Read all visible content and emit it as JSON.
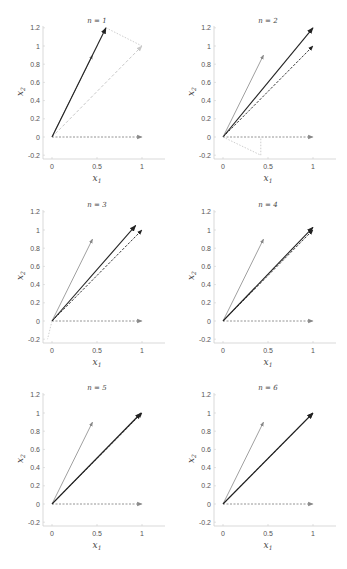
{
  "figure": {
    "panel_titles": [
      "n = 1",
      "n = 2",
      "n = 3",
      "n = 4",
      "n = 5",
      "n = 6"
    ],
    "xlabel": "x",
    "xlabel_sub": "1",
    "ylabel": "x",
    "ylabel_sub": "2",
    "xticks": [
      "0",
      "0.5",
      "1"
    ],
    "yticks": [
      "-0.2",
      "0",
      "0.2",
      "0.4",
      "0.6",
      "0.8",
      "1",
      "1.2"
    ]
  },
  "chart_data": [
    {
      "type": "line",
      "title": "n = 1",
      "xlabel": "x1",
      "ylabel": "x2",
      "xlim": [
        -0.03,
        1.2
      ],
      "ylim": [
        -0.25,
        1.22
      ],
      "xticks": [
        0,
        0.5,
        1
      ],
      "yticks": [
        -0.2,
        0,
        0.2,
        0.4,
        0.6,
        0.8,
        1,
        1.2
      ],
      "vectors": [
        {
          "name": "a1",
          "from": [
            0,
            0
          ],
          "to": [
            1,
            0
          ],
          "style": "dashed-gray"
        },
        {
          "name": "a2",
          "from": [
            0,
            0
          ],
          "to": [
            0.45,
            0.9
          ],
          "style": "solid-gray"
        },
        {
          "name": "target",
          "from": [
            0,
            0
          ],
          "to": [
            1,
            1
          ],
          "style": "dashed-light"
        },
        {
          "name": "approx",
          "from": [
            0,
            0
          ],
          "to": [
            0.6,
            1.2
          ],
          "style": "solid-dark"
        },
        {
          "name": "residual",
          "from": [
            0.6,
            1.2
          ],
          "to": [
            1,
            1
          ],
          "style": "dotted-light"
        }
      ]
    },
    {
      "type": "line",
      "title": "n = 2",
      "xlabel": "x1",
      "ylabel": "x2",
      "xlim": [
        -0.03,
        1.2
      ],
      "ylim": [
        -0.25,
        1.22
      ],
      "vectors": [
        {
          "name": "a1",
          "from": [
            0,
            0
          ],
          "to": [
            1,
            0
          ],
          "style": "dashed-gray"
        },
        {
          "name": "a2",
          "from": [
            0,
            0
          ],
          "to": [
            0.45,
            0.9
          ],
          "style": "solid-gray"
        },
        {
          "name": "target",
          "from": [
            0,
            0
          ],
          "to": [
            1,
            1
          ],
          "style": "dashed-dark"
        },
        {
          "name": "approx",
          "from": [
            0,
            0
          ],
          "to": [
            1.0,
            1.2
          ],
          "style": "solid-dark"
        },
        {
          "name": "residual",
          "from": [
            0,
            0
          ],
          "to": [
            0.42,
            -0.2
          ],
          "style": "dotted-light"
        },
        {
          "name": "residual-drop",
          "from": [
            0.42,
            -0.2
          ],
          "to": [
            0.42,
            0
          ],
          "style": "dotted-light"
        }
      ]
    },
    {
      "type": "line",
      "title": "n = 3",
      "xlabel": "x1",
      "ylabel": "x2",
      "xlim": [
        -0.03,
        1.2
      ],
      "ylim": [
        -0.25,
        1.22
      ],
      "vectors": [
        {
          "name": "a1",
          "from": [
            0,
            0
          ],
          "to": [
            1,
            0
          ],
          "style": "dashed-gray"
        },
        {
          "name": "a2",
          "from": [
            0,
            0
          ],
          "to": [
            0.45,
            0.9
          ],
          "style": "solid-gray"
        },
        {
          "name": "target",
          "from": [
            0,
            0
          ],
          "to": [
            1,
            1
          ],
          "style": "dashed-dark"
        },
        {
          "name": "approx",
          "from": [
            0,
            0
          ],
          "to": [
            0.93,
            1.05
          ],
          "style": "solid-dark"
        },
        {
          "name": "residual",
          "from": [
            0,
            0
          ],
          "to": [
            -0.05,
            -0.2
          ],
          "style": "dotted-light"
        }
      ]
    },
    {
      "type": "line",
      "title": "n = 4",
      "xlabel": "x1",
      "ylabel": "x2",
      "xlim": [
        -0.03,
        1.2
      ],
      "ylim": [
        -0.25,
        1.22
      ],
      "vectors": [
        {
          "name": "a1",
          "from": [
            0,
            0
          ],
          "to": [
            1,
            0
          ],
          "style": "dashed-gray"
        },
        {
          "name": "a2",
          "from": [
            0,
            0
          ],
          "to": [
            0.45,
            0.9
          ],
          "style": "solid-gray"
        },
        {
          "name": "target",
          "from": [
            0,
            0
          ],
          "to": [
            1,
            1
          ],
          "style": "dashed-dark"
        },
        {
          "name": "approx",
          "from": [
            0,
            0
          ],
          "to": [
            1.0,
            1.03
          ],
          "style": "solid-dark"
        }
      ]
    },
    {
      "type": "line",
      "title": "n = 5",
      "xlabel": "x1",
      "ylabel": "x2",
      "xlim": [
        -0.03,
        1.2
      ],
      "ylim": [
        -0.25,
        1.22
      ],
      "vectors": [
        {
          "name": "a1",
          "from": [
            0,
            0
          ],
          "to": [
            1,
            0
          ],
          "style": "dashed-gray"
        },
        {
          "name": "a2",
          "from": [
            0,
            0
          ],
          "to": [
            0.45,
            0.9
          ],
          "style": "solid-gray"
        },
        {
          "name": "target",
          "from": [
            0,
            0
          ],
          "to": [
            1,
            1
          ],
          "style": "dashed-dark"
        },
        {
          "name": "approx",
          "from": [
            0,
            0
          ],
          "to": [
            0.99,
            1.0
          ],
          "style": "solid-dark"
        }
      ]
    },
    {
      "type": "line",
      "title": "n = 6",
      "xlabel": "x1",
      "ylabel": "x2",
      "xlim": [
        -0.03,
        1.2
      ],
      "ylim": [
        -0.25,
        1.22
      ],
      "vectors": [
        {
          "name": "a1",
          "from": [
            0,
            0
          ],
          "to": [
            1,
            0
          ],
          "style": "dashed-gray"
        },
        {
          "name": "a2",
          "from": [
            0,
            0
          ],
          "to": [
            0.45,
            0.9
          ],
          "style": "solid-gray"
        },
        {
          "name": "target",
          "from": [
            0,
            0
          ],
          "to": [
            1,
            1
          ],
          "style": "dashed-dark"
        },
        {
          "name": "approx",
          "from": [
            0,
            0
          ],
          "to": [
            1.0,
            1.0
          ],
          "style": "solid-dark"
        }
      ]
    }
  ],
  "layout": {
    "panels": [
      {
        "x0px": 52,
        "y0px": 137,
        "axisLeft": 43,
        "axisBottom": 159,
        "axisRight": 165
      },
      {
        "x0px": 223,
        "y0px": 137,
        "axisLeft": 214,
        "axisBottom": 159,
        "axisRight": 336
      },
      {
        "x0px": 52,
        "y0px": 321,
        "axisLeft": 43,
        "axisBottom": 343,
        "axisRight": 165
      },
      {
        "x0px": 223,
        "y0px": 321,
        "axisLeft": 214,
        "axisBottom": 343,
        "axisRight": 336
      },
      {
        "x0px": 52,
        "y0px": 504,
        "axisLeft": 43,
        "axisBottom": 526,
        "axisRight": 165
      },
      {
        "x0px": 223,
        "y0px": 504,
        "axisLeft": 214,
        "axisBottom": 526,
        "axisRight": 336
      }
    ],
    "unitX": 90,
    "unitY": 91,
    "colors": {
      "axis": "#cfcfcf",
      "dark": "#222222",
      "gray": "#888888",
      "light": "#c8c8c8",
      "text": "#555555"
    }
  }
}
